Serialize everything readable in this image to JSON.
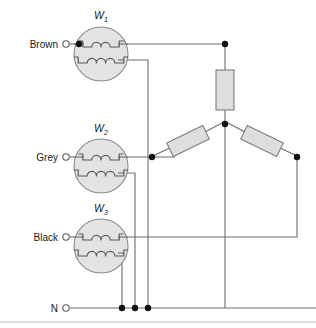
{
  "diagram": {
    "canvas": {
      "width": 316,
      "height": 328
    },
    "colors": {
      "wire": "#6e6e6e",
      "winding_fill": "#e3e3e3",
      "winding_stroke": "#8a8a8a",
      "resistor_fill": "#dedede",
      "resistor_stroke": "#7d7d7d",
      "node": "#111111",
      "text": "#1a1a1a",
      "background": "#ffffff"
    }
  },
  "terminals": [
    {
      "id": "brown",
      "label": "Brown",
      "label_x": 58,
      "label_y": 48,
      "ring_x": 66,
      "ring_y": 44,
      "ring_r": 3.2
    },
    {
      "id": "grey",
      "label": "Grey",
      "label_x": 58,
      "label_y": 161,
      "ring_x": 66,
      "ring_y": 157,
      "ring_r": 3.2
    },
    {
      "id": "black",
      "label": "Black",
      "label_x": 58,
      "label_y": 241,
      "ring_x": 66,
      "ring_y": 237,
      "ring_r": 3.2
    },
    {
      "id": "neutral",
      "label": "N",
      "label_x": 58,
      "label_y": 312,
      "ring_x": 66,
      "ring_y": 308,
      "ring_r": 3.2
    }
  ],
  "windings": [
    {
      "id": "w1",
      "label": "W",
      "subscript": "1",
      "label_x": 101,
      "label_y": 19,
      "cx": 101,
      "cy": 54,
      "r": 27,
      "upper_coil_y": 44,
      "lower_coil_y": 60,
      "upper_humps": 2,
      "lower_humps": 3,
      "has_input_node": true
    },
    {
      "id": "w2",
      "label": "W",
      "subscript": "2",
      "label_x": 101,
      "label_y": 132,
      "cx": 101,
      "cy": 166,
      "r": 27,
      "upper_coil_y": 157,
      "lower_coil_y": 173,
      "upper_humps": 2,
      "lower_humps": 3,
      "has_input_node": false
    },
    {
      "id": "w3",
      "label": "W",
      "subscript": "3",
      "label_x": 101,
      "label_y": 212,
      "cx": 101,
      "cy": 246,
      "r": 27,
      "upper_coil_y": 237,
      "lower_coil_y": 253,
      "upper_humps": 2,
      "lower_humps": 3,
      "has_input_node": false
    }
  ],
  "resistors": [
    {
      "id": "r-vertical",
      "orientation": "vertical",
      "x": 216,
      "y": 70,
      "width": 18,
      "height": 40,
      "rotation": 0
    },
    {
      "id": "r-left-diagonal",
      "orientation": "diagonal",
      "cx": 188,
      "cy": 141,
      "width": 40,
      "height": 15,
      "rotation": -26
    },
    {
      "id": "r-right-diagonal",
      "orientation": "diagonal",
      "cx": 262,
      "cy": 141,
      "width": 40,
      "height": 15,
      "rotation": 26
    }
  ],
  "junction_nodes": [
    {
      "id": "node-w1-input",
      "x": 79,
      "y": 44,
      "r": 3.2
    },
    {
      "id": "node-top-right",
      "x": 225,
      "y": 44,
      "r": 3.2
    },
    {
      "id": "node-star-center",
      "x": 225,
      "y": 124,
      "r": 3.2
    },
    {
      "id": "node-left-branch",
      "x": 152,
      "y": 157,
      "r": 3.2
    },
    {
      "id": "node-right-branch",
      "x": 297,
      "y": 157,
      "r": 3.2
    },
    {
      "id": "node-neutral-1",
      "x": 122,
      "y": 308,
      "r": 3.2
    },
    {
      "id": "node-neutral-2",
      "x": 135,
      "y": 308,
      "r": 3.2
    },
    {
      "id": "node-neutral-3",
      "x": 148,
      "y": 308,
      "r": 3.2
    }
  ],
  "wires": [
    {
      "id": "wire-brown-lead",
      "d": "M 70 44 L 79 44"
    },
    {
      "id": "wire-w1-top-out",
      "d": "M 123 44 L 225 44"
    },
    {
      "id": "wire-w1-bottom-out",
      "d": "M 123 60 L 148 60 L 148 308"
    },
    {
      "id": "wire-grey-lead",
      "d": "M 70 157 L 79 157"
    },
    {
      "id": "wire-w2-top-out",
      "d": "M 123 157 L 175 157"
    },
    {
      "id": "wire-w2-bottom-out",
      "d": "M 123 173 L 135 173 L 135 308"
    },
    {
      "id": "wire-black-lead",
      "d": "M 70 237 L 79 237"
    },
    {
      "id": "wire-w3-top-out",
      "d": "M 123 237 L 297 237 L 297 160"
    },
    {
      "id": "wire-w3-bottom-out",
      "d": "M 123 253 L 122 253 L 122 308"
    },
    {
      "id": "wire-neutral-bus",
      "d": "M 70 308 L 316 308"
    },
    {
      "id": "wire-vertical-resistor-top",
      "d": "M 225 47 L 225 70"
    },
    {
      "id": "wire-vertical-resistor-bottom",
      "d": "M 225 110 L 225 124"
    },
    {
      "id": "wire-star-to-neutral",
      "d": "M 225 127 L 225 308"
    },
    {
      "id": "wire-left-diagonal-in",
      "d": "M 155 155 L 172 147"
    },
    {
      "id": "wire-left-diagonal-out",
      "d": "M 205 132 L 222 123"
    },
    {
      "id": "wire-right-diagonal-in",
      "d": "M 228 123 L 245 132"
    },
    {
      "id": "wire-right-diagonal-out",
      "d": "M 278 147 L 295 155"
    }
  ],
  "bottom_rule": {
    "id": "bottom-rule",
    "x1": 0,
    "y1": 322,
    "x2": 316,
    "y2": 322
  }
}
